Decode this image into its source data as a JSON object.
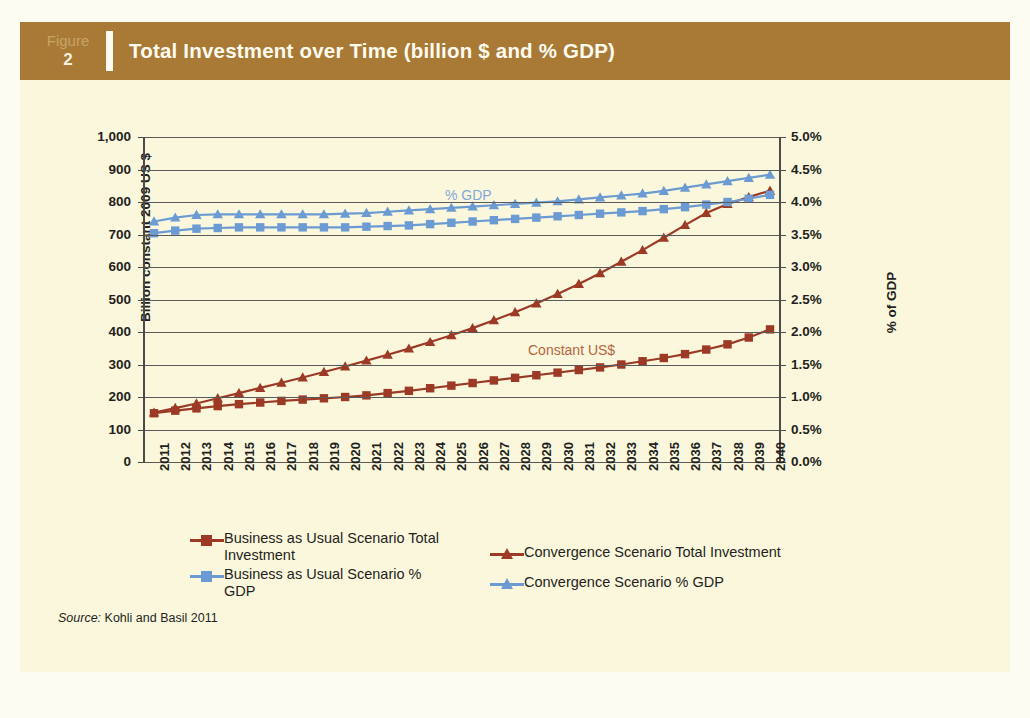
{
  "header": {
    "figure_word": "Figure",
    "figure_number": "2",
    "title": "Total Investment over Time (billion $ and % GDP)"
  },
  "source": {
    "label": "Source:",
    "text": " Kohli and Basil 2011"
  },
  "colors": {
    "band": "#a87a35",
    "panel": "#fbf7dd",
    "red": "#9c3a26",
    "blue": "#6b9bd2",
    "annotation_gdp": "#7fa8d8",
    "annotation_usd": "#b5643c",
    "axis": "#4b4b4b"
  },
  "legend": {
    "items": [
      {
        "label": "Business as Usual Scenario Total Investment",
        "color": "#9c3a26",
        "marker": "square"
      },
      {
        "label": "Convergence Scenario Total Investment",
        "color": "#9c3a26",
        "marker": "triangle"
      },
      {
        "label": "Business as Usual Scenario % GDP",
        "color": "#6b9bd2",
        "marker": "square"
      },
      {
        "label": "Convergence Scenario % GDP",
        "color": "#6b9bd2",
        "marker": "triangle"
      }
    ]
  },
  "chart_data": {
    "type": "line",
    "title": "Total Investment over Time (billion $ and % GDP)",
    "xlabel": "",
    "ylabel": "Billion constant 2009 US $",
    "y2label": "% of GDP",
    "ylim": [
      0,
      1000
    ],
    "y2lim": [
      0.0,
      5.0
    ],
    "grid": true,
    "legend_position": "bottom",
    "annotations": [
      {
        "text": "% GDP",
        "color": "#7fa8d8"
      },
      {
        "text": "Constant US$",
        "color": "#b5643c"
      }
    ],
    "yticks": [
      "0",
      "100",
      "200",
      "300",
      "400",
      "500",
      "600",
      "700",
      "800",
      "900",
      "1,000"
    ],
    "y2ticks": [
      "0.0%",
      "0.5%",
      "1.0%",
      "1.5%",
      "2.0%",
      "2.5%",
      "3.0%",
      "3.5%",
      "4.0%",
      "4.5%",
      "5.0%"
    ],
    "categories": [
      "2011",
      "2012",
      "2013",
      "2014",
      "2015",
      "2016",
      "2017",
      "2018",
      "2019",
      "2020",
      "2021",
      "2022",
      "2023",
      "2024",
      "2025",
      "2026",
      "2027",
      "2028",
      "2029",
      "2030",
      "2031",
      "2032",
      "2033",
      "2034",
      "2035",
      "2036",
      "2037",
      "2038",
      "2039",
      "2040"
    ],
    "series": [
      {
        "name": "Business as Usual Scenario Total Investment",
        "axis": "left",
        "units": "billion constant 2009 US$",
        "color": "#9c3a26",
        "marker": "square",
        "values": [
          150,
          158,
          165,
          172,
          178,
          183,
          188,
          192,
          196,
          200,
          205,
          212,
          219,
          227,
          235,
          243,
          251,
          259,
          267,
          275,
          283,
          291,
          300,
          310,
          320,
          332,
          346,
          362,
          383,
          408
        ]
      },
      {
        "name": "Convergence Scenario Total Investment",
        "axis": "left",
        "units": "billion constant 2009 US$",
        "color": "#9c3a26",
        "marker": "triangle",
        "values": [
          152,
          166,
          180,
          196,
          212,
          228,
          244,
          260,
          277,
          294,
          312,
          330,
          349,
          369,
          390,
          412,
          436,
          461,
          488,
          517,
          548,
          581,
          616,
          652,
          690,
          729,
          766,
          794,
          815,
          835
        ]
      },
      {
        "name": "Business as Usual Scenario % GDP",
        "axis": "right",
        "units": "% of GDP",
        "color": "#6b9bd2",
        "marker": "square",
        "values": [
          3.52,
          3.56,
          3.59,
          3.6,
          3.61,
          3.61,
          3.61,
          3.61,
          3.61,
          3.61,
          3.62,
          3.63,
          3.64,
          3.66,
          3.68,
          3.7,
          3.72,
          3.74,
          3.76,
          3.78,
          3.8,
          3.82,
          3.84,
          3.86,
          3.89,
          3.92,
          3.96,
          4.0,
          4.05,
          4.11
        ]
      },
      {
        "name": "Convergence Scenario % GDP",
        "axis": "right",
        "units": "% of GDP",
        "color": "#6b9bd2",
        "marker": "triangle",
        "values": [
          3.7,
          3.76,
          3.8,
          3.81,
          3.81,
          3.81,
          3.81,
          3.81,
          3.81,
          3.82,
          3.83,
          3.85,
          3.87,
          3.89,
          3.91,
          3.93,
          3.95,
          3.97,
          3.99,
          4.01,
          4.04,
          4.07,
          4.1,
          4.13,
          4.17,
          4.22,
          4.27,
          4.32,
          4.37,
          4.42
        ]
      }
    ]
  }
}
